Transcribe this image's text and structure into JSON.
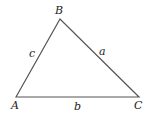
{
  "diagram": {
    "type": "triangle",
    "stroke_color": "#555555",
    "vertices": [
      {
        "id": "A",
        "label": "A",
        "x": 16,
        "y": 97,
        "label_x": 11,
        "label_y": 109
      },
      {
        "id": "B",
        "label": "B",
        "x": 60,
        "y": 19,
        "label_x": 55,
        "label_y": 14
      },
      {
        "id": "C",
        "label": "C",
        "x": 139,
        "y": 97,
        "label_x": 134,
        "label_y": 109
      }
    ],
    "sides": [
      {
        "id": "a",
        "label": "a",
        "from": "B",
        "to": "C",
        "label_x": 99,
        "label_y": 55
      },
      {
        "id": "b",
        "label": "b",
        "from": "A",
        "to": "C",
        "label_x": 74,
        "label_y": 110
      },
      {
        "id": "c",
        "label": "c",
        "from": "A",
        "to": "B",
        "label_x": 29,
        "label_y": 57
      }
    ]
  }
}
